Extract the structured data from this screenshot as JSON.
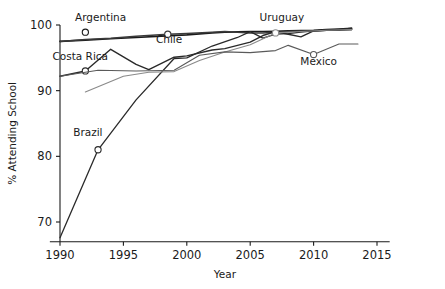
{
  "chart_data": {
    "type": "line",
    "title": "",
    "xlabel": "Year",
    "ylabel": "% Attending School",
    "xlim": [
      1989.2,
      2016.0
    ],
    "ylim": [
      67.0,
      100.8
    ],
    "xticks": [
      1990,
      1995,
      2000,
      2005,
      2010,
      2015
    ],
    "xtick_labels": [
      "1990",
      "1995",
      "2000",
      "2005",
      "2010",
      "2015"
    ],
    "yticks": [
      70,
      80,
      90,
      100
    ],
    "ytick_labels": [
      "70",
      "80",
      "90",
      "100"
    ],
    "grid": false,
    "legend": "inline-labels",
    "series": [
      {
        "name": "Argentina",
        "color": "#1a1a1a",
        "width": 1.6,
        "label_x": 1993.2,
        "label_y": 100.6,
        "label_anchor": "middle",
        "marker_point": {
          "x": 1992.0,
          "y": 98.9
        },
        "x": [
          1990,
          1992,
          1994,
          1996,
          1998,
          2000,
          2002,
          2003,
          2004,
          2005,
          2006,
          2007,
          2008,
          2009,
          2010,
          2011,
          2012,
          2013
        ],
        "y": [
          97.5,
          97.7,
          97.9,
          98.1,
          98.3,
          98.5,
          98.8,
          98.9,
          98.95,
          99.0,
          99.0,
          99.05,
          99.1,
          99.15,
          99.2,
          99.3,
          99.4,
          99.5
        ]
      },
      {
        "name": "Chile",
        "color": "#3a3a3a",
        "width": 1.5,
        "label_x": 1998.6,
        "label_y": 97.2,
        "label_anchor": "middle",
        "marker_point": {
          "x": 1998.5,
          "y": 98.6
        },
        "x": [
          1990,
          1992,
          1994,
          1996,
          1998.5,
          2000,
          2002,
          2003,
          2004,
          2005,
          2006,
          2007,
          2008,
          2009,
          2010,
          2011,
          2012,
          2013
        ],
        "y": [
          97.5,
          97.8,
          98.0,
          98.3,
          98.6,
          98.7,
          98.9,
          99.0,
          98.9,
          98.8,
          98.8,
          98.9,
          99.0,
          99.1,
          99.1,
          99.2,
          99.3,
          99.3
        ]
      },
      {
        "name": "Costa Rica",
        "color": "#2a2a2a",
        "width": 1.4,
        "label_x": 1991.6,
        "label_y": 94.6,
        "label_anchor": "middle",
        "marker_point": {
          "x": 1992.0,
          "y": 93.0
        },
        "x": [
          1990,
          1992,
          1994,
          1996,
          1997,
          1999,
          2000,
          2002,
          2003,
          2005,
          2006,
          2007,
          2008,
          2009,
          2010,
          2011,
          2012,
          2013
        ],
        "y": [
          92.2,
          93.0,
          96.3,
          94.0,
          93.2,
          95.1,
          95.3,
          96.2,
          96.4,
          97.4,
          98.4,
          99.0,
          98.6,
          98.2,
          99.1,
          99.2,
          99.3,
          99.5
        ]
      },
      {
        "name": "Brazil",
        "color": "#2a2a2a",
        "width": 1.3,
        "label_x": 1992.2,
        "label_y": 83.1,
        "label_anchor": "middle",
        "marker_point": {
          "x": 1993.0,
          "y": 81.0
        },
        "x": [
          1990,
          1993,
          1996,
          1999,
          2000,
          2002,
          2004,
          2005,
          2006,
          2007,
          2008,
          2009,
          2010,
          2011,
          2012,
          2013
        ],
        "y": [
          67.6,
          81.0,
          88.6,
          94.9,
          95.0,
          96.8,
          98.1,
          99.0,
          98.0,
          98.6,
          98.7,
          98.9,
          99.1,
          99.2,
          99.2,
          99.3
        ]
      },
      {
        "name": "Uruguay",
        "color": "#8a8a8a",
        "width": 1.1,
        "label_x": 2007.5,
        "label_y": 100.6,
        "label_anchor": "middle",
        "marker_point": {
          "x": 2007.0,
          "y": 98.8
        },
        "x": [
          1992,
          1995,
          1997,
          1999,
          2001,
          2003,
          2005,
          2007,
          2009,
          2011,
          2013
        ],
        "y": [
          89.8,
          92.2,
          92.8,
          92.9,
          94.6,
          95.9,
          97.0,
          98.8,
          99.0,
          99.2,
          99.3
        ]
      },
      {
        "name": "Mexico",
        "color": "#5a5a5a",
        "width": 1.1,
        "label_x": 2010.4,
        "label_y": 93.9,
        "label_anchor": "middle",
        "marker_point": {
          "x": 2010.0,
          "y": 95.5
        },
        "x": [
          1990,
          1993,
          1996,
          1999,
          2001,
          2003,
          2005,
          2007,
          2008,
          2010,
          2012,
          2013.5
        ],
        "y": [
          92.2,
          93.1,
          93.0,
          93.1,
          95.4,
          95.9,
          95.8,
          96.1,
          96.9,
          95.5,
          97.1,
          97.1
        ]
      }
    ]
  }
}
